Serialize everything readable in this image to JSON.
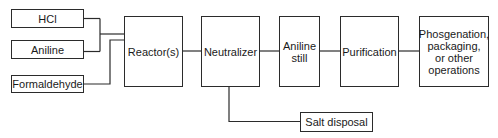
{
  "diagram": {
    "type": "process-flow",
    "inputs": [
      {
        "id": "hcl",
        "label": "HCl"
      },
      {
        "id": "aniline",
        "label": "Aniline"
      },
      {
        "id": "formaldehyde",
        "label": "Formaldehyde"
      }
    ],
    "stages": [
      {
        "id": "reactor",
        "label": "Reactor(s)"
      },
      {
        "id": "neutralizer",
        "label": "Neutralizer"
      },
      {
        "id": "aniline_still",
        "label": "Aniline\nstill"
      },
      {
        "id": "purification",
        "label": "Purification"
      },
      {
        "id": "final",
        "label": "Phosgenation,\npackaging,\nor other\noperations"
      }
    ],
    "side_outputs": [
      {
        "id": "salt",
        "label": "Salt disposal",
        "from": "neutralizer"
      }
    ],
    "edges": [
      [
        "hcl",
        "reactor"
      ],
      [
        "aniline",
        "reactor"
      ],
      [
        "formaldehyde",
        "reactor"
      ],
      [
        "reactor",
        "neutralizer"
      ],
      [
        "neutralizer",
        "aniline_still"
      ],
      [
        "aniline_still",
        "purification"
      ],
      [
        "purification",
        "final"
      ],
      [
        "neutralizer",
        "salt"
      ]
    ],
    "line_color": "#2b2b2b"
  }
}
